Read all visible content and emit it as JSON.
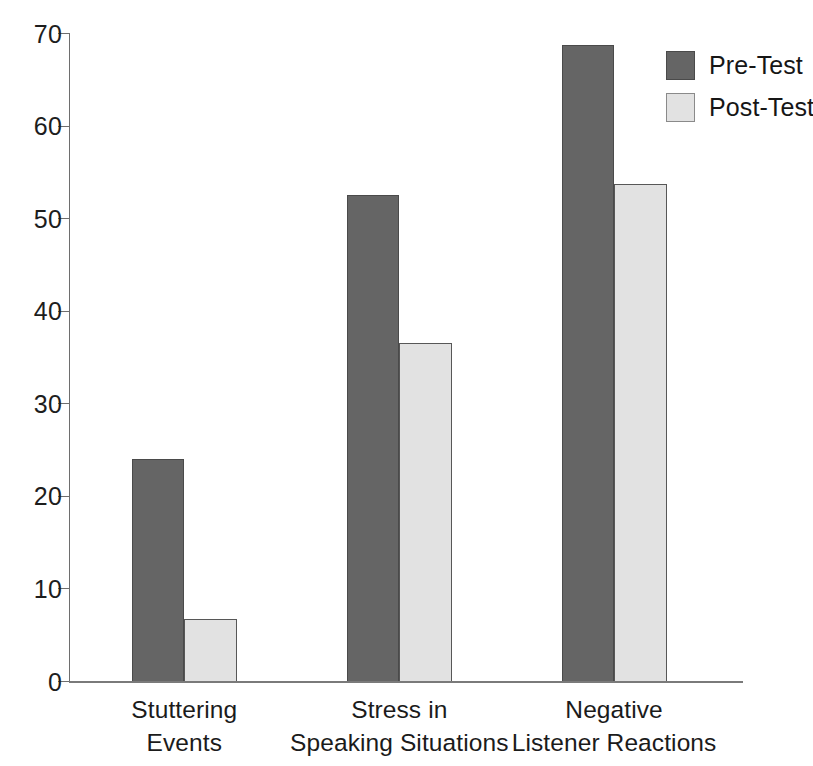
{
  "chart_data": {
    "type": "bar",
    "title": "",
    "subtitle": "",
    "xlabel": "",
    "ylabel": "",
    "ylim": [
      0,
      70
    ],
    "yticks": [
      0,
      10,
      20,
      30,
      40,
      50,
      60,
      70
    ],
    "ytick_labels": [
      "0",
      "10",
      "20",
      "30",
      "40",
      "50",
      "60",
      "70"
    ],
    "grid": false,
    "legend_position": "top-right",
    "categories": [
      "Stuttering\nEvents",
      "Stress in\nSpeaking Situations",
      "Negative\nListener Reactions"
    ],
    "series": [
      {
        "name": "Pre-Test",
        "color": "#656565",
        "values": [
          24.0,
          52.5,
          68.7
        ]
      },
      {
        "name": "Post-Test",
        "color": "#e2e2e2",
        "values": [
          6.7,
          36.5,
          53.7
        ]
      }
    ]
  },
  "legend": {
    "items": [
      {
        "label": "Pre-Test",
        "color": "#656565"
      },
      {
        "label": "Post-Test",
        "color": "#e2e2e2"
      }
    ]
  },
  "axis": {
    "y_max_label": "70",
    "y_min_label": "0"
  },
  "colors": {
    "pre_test": "#656565",
    "post_test": "#e2e2e2",
    "axis": "#6e6e6e",
    "text": "#1b1b1b",
    "background": "#ffffff"
  }
}
